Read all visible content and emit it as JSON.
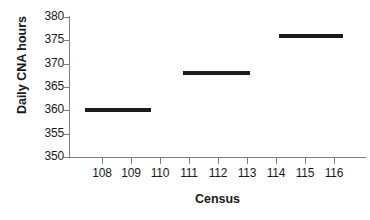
{
  "chart_data": {
    "type": "line",
    "title": "",
    "xlabel": "Census",
    "ylabel": "Daily CNA hours",
    "xlim": [
      107.4,
      116.6
    ],
    "ylim": [
      350,
      380
    ],
    "grid": false,
    "legend": null,
    "x_ticks": [
      108,
      109,
      110,
      111,
      112,
      113,
      114,
      115,
      116
    ],
    "x_tick_labels": [
      "108",
      "109",
      "110",
      "111",
      "112",
      "113",
      "114",
      "115",
      "116"
    ],
    "y_ticks": [
      350,
      355,
      360,
      365,
      370,
      375,
      380
    ],
    "y_tick_labels": [
      "350",
      "355",
      "360",
      "365",
      "370",
      "375",
      "380"
    ],
    "series": [
      {
        "name": "Daily CNA hours",
        "style": "step-segments",
        "color": "#1c1c1c",
        "segments": [
          {
            "label": "108-110",
            "x_start": 107.4,
            "x_end": 109.7,
            "value": 360
          },
          {
            "label": "111-113",
            "x_start": 110.8,
            "x_end": 113.1,
            "value": 368
          },
          {
            "label": "114-116",
            "x_start": 114.1,
            "x_end": 116.3,
            "value": 376
          }
        ]
      }
    ]
  },
  "axes": {
    "x_title": "Census",
    "y_title": "Daily CNA hours"
  }
}
